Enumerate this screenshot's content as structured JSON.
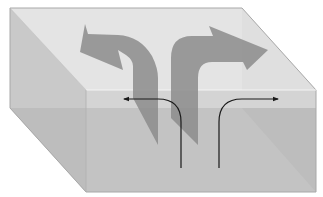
{
  "diagram": {
    "type": "3d-box-flow-illustration",
    "labels": [],
    "colors": {
      "background": "#ffffff",
      "top_face": "#e4e4e4",
      "top_face_front_strip": "#d9d9d9",
      "left_face": "#c9c9c9",
      "front_face_upper": "#d2d2d2",
      "front_face_lower": "#c0c0c0",
      "right_shadow": "#b7b7b7",
      "edge": "#a8a8a8",
      "highlight_edge": "#f4f4f4",
      "arrow_fill": "#8c8c8c",
      "arrow_fill_alpha": 0.85,
      "flow_line": "#1a1a1a"
    },
    "elements": {
      "box": "translucent rectangular prism viewed from front-left-above",
      "wide_arrows": [
        "left-curving arrow",
        "right-curving arrow"
      ],
      "flow_lines": [
        "line curving up then left",
        "line curving up then right"
      ]
    }
  }
}
